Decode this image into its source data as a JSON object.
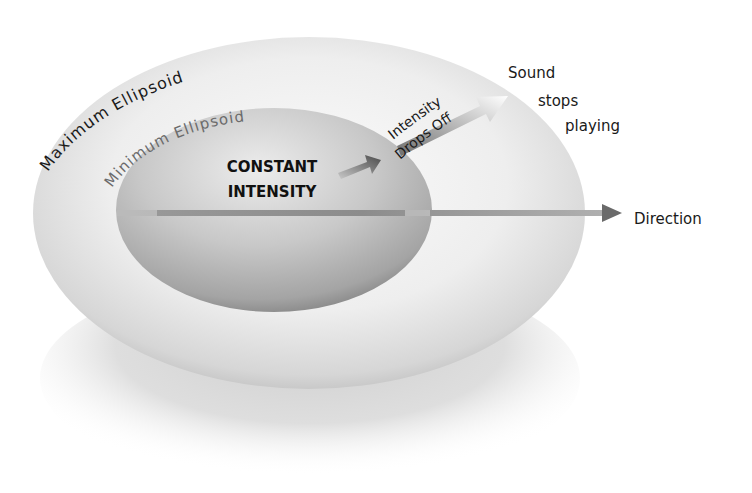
{
  "diagram": {
    "labels": {
      "maximum_ellipsoid": "Maximum Ellipsoid",
      "minimum_ellipsoid": "Minimum Ellipsoid",
      "constant_line1": "CONSTANT",
      "constant_line2": "INTENSITY",
      "drops_line1": "Intensity",
      "drops_line2": "Drops Off",
      "sound_line1": "Sound",
      "sound_line2": "stops",
      "sound_line3": "playing",
      "direction": "Direction"
    },
    "colors": {
      "outer_light": "#f4f4f4",
      "outer_dark": "#c4c4c4",
      "inner_light": "#e2e2e2",
      "inner_dark": "#8a8a8a",
      "arrow": "#6a6a6a",
      "text": "#111111",
      "min_label": "#6b6b6b"
    }
  }
}
